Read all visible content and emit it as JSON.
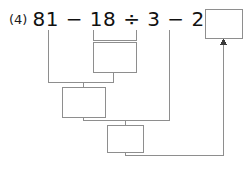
{
  "problem": {
    "number_label": "(4)",
    "expression": "81 − 18 ÷ 3 − 21 =",
    "operands": [
      "81",
      "18",
      "3",
      "21"
    ],
    "operators": [
      "−",
      "÷",
      "−"
    ],
    "equals_sign": "="
  },
  "work_boxes": [
    {
      "name": "step1-box",
      "value": ""
    },
    {
      "name": "step2-box",
      "value": ""
    },
    {
      "name": "step3-box",
      "value": ""
    }
  ],
  "answer_box": {
    "value": "",
    "label": ""
  },
  "colors": {
    "line": "#8e8e8e",
    "text": "#111111",
    "background": "#ffffff"
  }
}
